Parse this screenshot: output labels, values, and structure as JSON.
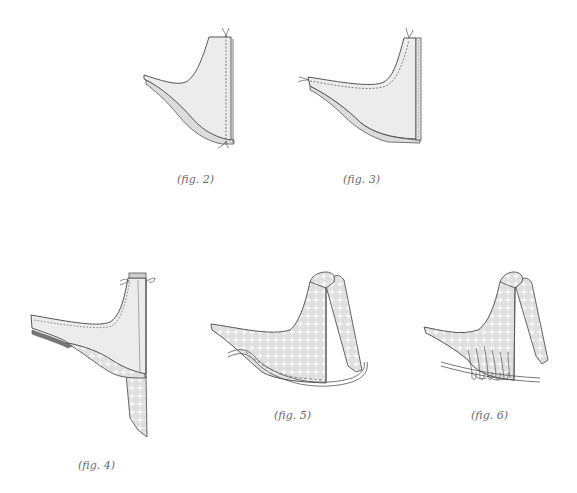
{
  "figures": [
    {
      "id": "fig2",
      "caption": "(fig. 2)",
      "description": "Fabric piece with stitched seam along right edge, thread ends tied at top and bottom"
    },
    {
      "id": "fig3",
      "caption": "(fig. 3)",
      "description": "Fabric piece with seam stitched along arm and neck, binding strip along right edge"
    },
    {
      "id": "fig4",
      "caption": "(fig. 4)",
      "description": "Piece with patterned lining folded under and a patterned strip hanging down"
    },
    {
      "id": "fig5",
      "caption": "(fig. 5)",
      "description": "Patterned piece turned with strap folded over, cord laid along bottom curve"
    },
    {
      "id": "fig6",
      "caption": "(fig. 6)",
      "description": "Patterned piece with strap, gathered stitches wrapped over cord along bottom edge"
    }
  ],
  "colors": {
    "fabric": "#eaeaea",
    "outline": "#555555",
    "pattern_bg": "#e2e2e2",
    "pattern_flower": "#f7f7f7",
    "caption": "#6a6a6a"
  }
}
